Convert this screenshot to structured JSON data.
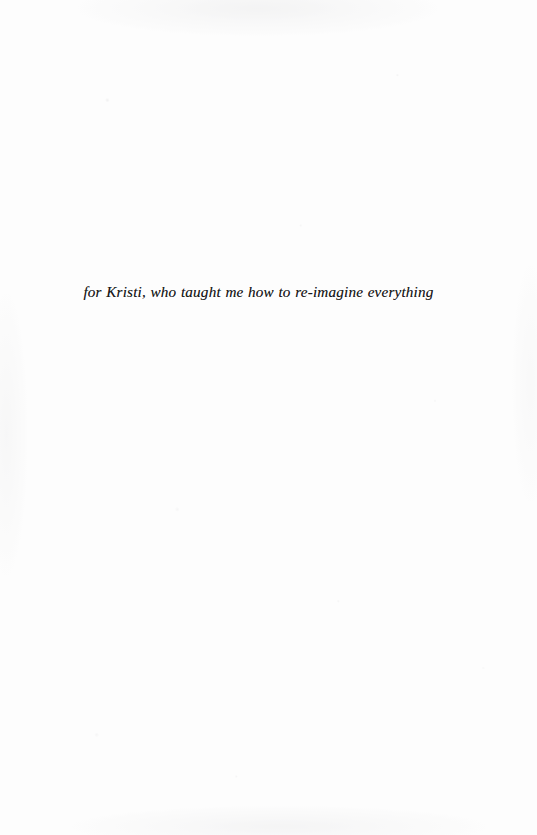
{
  "page": {
    "kind": "book-dedication-page",
    "background_color": "#fdfdfd",
    "width": 537,
    "height": 835
  },
  "dedication": {
    "text": "for Kristi, who taught me how to re-imagine everything",
    "style": "italic",
    "alignment": "center",
    "text_color": "#181818"
  }
}
